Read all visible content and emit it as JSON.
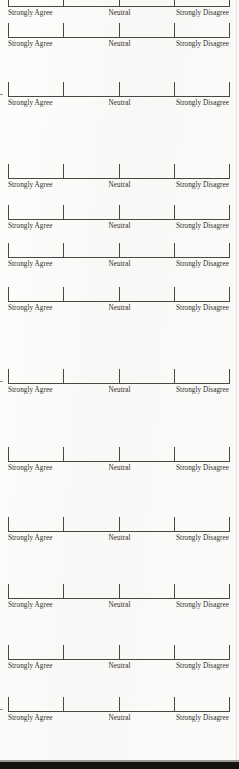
{
  "document": {
    "kind": "scanned-questionnaire-page",
    "background_color": "#fcfcfb",
    "ink_color": "#4a4843",
    "text_color": "#2e2b28",
    "bottom_band_color": "#14120f",
    "page_edge_color": "#e2e2df"
  },
  "scale_labels": {
    "left": "Strongly Agree",
    "middle": "Neutral",
    "right": "Strongly Disagree"
  },
  "scale_ticks": [
    0,
    25,
    50,
    75,
    100
  ],
  "scales": [
    {
      "id": 1,
      "top": -12,
      "cut_off": true,
      "left_edge_mark": false
    },
    {
      "id": 2,
      "top": 19,
      "cut_off": false,
      "left_edge_mark": false
    },
    {
      "id": 3,
      "top": 78,
      "cut_off": false,
      "left_edge_mark": true
    },
    {
      "id": 4,
      "top": 160,
      "cut_off": false,
      "left_edge_mark": false
    },
    {
      "id": 5,
      "top": 201,
      "cut_off": false,
      "left_edge_mark": false
    },
    {
      "id": 6,
      "top": 239,
      "cut_off": false,
      "left_edge_mark": false
    },
    {
      "id": 7,
      "top": 283,
      "cut_off": false,
      "left_edge_mark": false
    },
    {
      "id": 8,
      "top": 365,
      "cut_off": false,
      "left_edge_mark": true
    },
    {
      "id": 9,
      "top": 443,
      "cut_off": false,
      "left_edge_mark": false
    },
    {
      "id": 10,
      "top": 513,
      "cut_off": false,
      "left_edge_mark": false
    },
    {
      "id": 11,
      "top": 580,
      "cut_off": false,
      "left_edge_mark": false
    },
    {
      "id": 12,
      "top": 641,
      "cut_off": false,
      "left_edge_mark": false
    },
    {
      "id": 13,
      "top": 693,
      "cut_off": false,
      "left_edge_mark": true
    }
  ],
  "page_edge_x": 236
}
